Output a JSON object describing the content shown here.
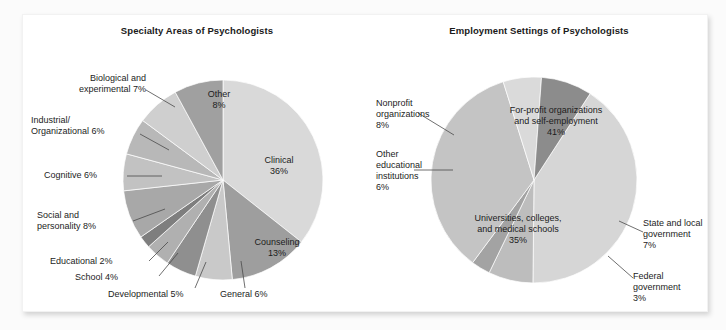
{
  "figure": {
    "background": "#ffffff",
    "page_background": "#fbfbfb"
  },
  "chart_data": [
    {
      "type": "pie",
      "id": "specialty-areas",
      "title": "Specialty Areas of Psychologists",
      "xlabel": "",
      "ylabel": "",
      "legend_position": "none",
      "grid": false,
      "categories": [
        "Clinical",
        "Counseling",
        "General",
        "Developmental",
        "School",
        "Educational",
        "Social and personality",
        "Cognitive",
        "Industrial/ Organizational",
        "Biological and experimental",
        "Other"
      ],
      "values": [
        36,
        13,
        6,
        5,
        4,
        2,
        8,
        6,
        6,
        7,
        8
      ],
      "unit": "%",
      "colors": [
        "#d9d9d9",
        "#9e9e9e",
        "#c9c9c9",
        "#8f8f8f",
        "#b0b0b0",
        "#7e7e7e",
        "#a8a8a8",
        "#c2c2c2",
        "#b8b8b8",
        "#cfcfcf",
        "#a0a0a0"
      ],
      "labels": [
        {
          "name": "Clinical",
          "text": "Clinical\n36%",
          "placement": "inside"
        },
        {
          "name": "Counseling",
          "text": "Counseling\n13%",
          "placement": "inside"
        },
        {
          "name": "Other",
          "text": "Other\n8%",
          "placement": "inside"
        },
        {
          "name": "General",
          "text": "General 6%",
          "placement": "outside"
        },
        {
          "name": "Developmental",
          "text": "Developmental 5%",
          "placement": "outside"
        },
        {
          "name": "School",
          "text": "School 4%",
          "placement": "outside"
        },
        {
          "name": "Educational",
          "text": "Educational 2%",
          "placement": "outside"
        },
        {
          "name": "Social and personality",
          "text": "Social and\npersonality 8%",
          "placement": "outside"
        },
        {
          "name": "Cognitive",
          "text": "Cognitive 6%",
          "placement": "outside"
        },
        {
          "name": "Industrial/Organizational",
          "text": "Industrial/\nOrganizational 6%",
          "placement": "outside"
        },
        {
          "name": "Biological and experimental",
          "text": "Biological and\nexperimental 7%",
          "placement": "outside"
        }
      ]
    },
    {
      "type": "pie",
      "id": "employment-settings",
      "title": "Employment Settings of Psychologists",
      "xlabel": "",
      "ylabel": "",
      "legend_position": "none",
      "grid": false,
      "categories": [
        "For-profit organizations and self-employment",
        "State and local government",
        "Federal government",
        "Universities, colleges, and medical schools",
        "Other educational institutions",
        "Nonprofit organizations"
      ],
      "values": [
        41,
        7,
        3,
        35,
        6,
        8
      ],
      "unit": "%",
      "colors": [
        "#d6d6d6",
        "#bdbdbd",
        "#a3a3a3",
        "#c4c4c4",
        "#dadada",
        "#8c8c8c"
      ],
      "labels": [
        {
          "name": "For-profit organizations and self-employment",
          "text": "For-profit organizations\nand self-employment\n41%",
          "placement": "inside"
        },
        {
          "name": "Universities, colleges, and medical schools",
          "text": "Universities, colleges,\nand medical schools\n35%",
          "placement": "inside"
        },
        {
          "name": "State and local government",
          "text": "State and local\ngovernment\n7%",
          "placement": "outside"
        },
        {
          "name": "Federal government",
          "text": "Federal\ngovernment\n3%",
          "placement": "outside"
        },
        {
          "name": "Other educational institutions",
          "text": "Other\neducational\ninstitutions\n6%",
          "placement": "outside"
        },
        {
          "name": "Nonprofit organizations",
          "text": "Nonprofit\norganizations\n8%",
          "placement": "outside"
        }
      ]
    }
  ],
  "left_chart": {
    "title": "Specialty Areas of Psychologists",
    "inside_labels": {
      "clinical": "Clinical\n36%",
      "counseling": "Counseling\n13%",
      "other": "Other\n8%"
    },
    "outside_labels": {
      "biological": "Biological and\nexperimental 7%",
      "industrial": "Industrial/\nOrganizational 6%",
      "cognitive": "Cognitive 6%",
      "social": "Social and\npersonality 8%",
      "educational": "Educational 2%",
      "school": "School 4%",
      "developmental": "Developmental 5%",
      "general": "General 6%"
    }
  },
  "right_chart": {
    "title": "Employment Settings of Psychologists",
    "inside_labels": {
      "for_profit": "For-profit organizations\nand self-employment\n41%",
      "universities": "Universities, colleges,\nand medical schools\n35%"
    },
    "outside_labels": {
      "nonprofit": "Nonprofit\norganizations\n8%",
      "other_educational": "Other\neducational\ninstitutions\n6%",
      "state_local": "State and local\ngovernment\n7%",
      "federal": "Federal\ngovernment\n3%"
    }
  }
}
